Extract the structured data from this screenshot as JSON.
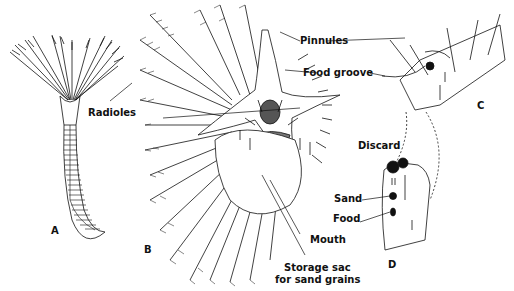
{
  "figure": {
    "panels": [
      {
        "id": "A",
        "letter": "A",
        "description": "Whole fan worm with radioles crown and segmented body"
      },
      {
        "id": "B",
        "letter": "B",
        "description": "Crown viewed from above showing feeding currents"
      },
      {
        "id": "C",
        "letter": "C",
        "description": "Section of radiole with pinnules and food groove"
      },
      {
        "id": "D",
        "letter": "D",
        "description": "Sorting of particles by size at base"
      }
    ],
    "labels": {
      "radioles": "Radioles",
      "pinnules": "Pinnules",
      "food_groove": "Food groove",
      "mouth": "Mouth",
      "storage_line1": "Storage sac",
      "storage_line2": "for sand grains",
      "discard": "Discard",
      "sand": "Sand",
      "food": "Food"
    },
    "colors": {
      "ink": "#111111",
      "background": "#ffffff",
      "shade": "#555555"
    }
  }
}
